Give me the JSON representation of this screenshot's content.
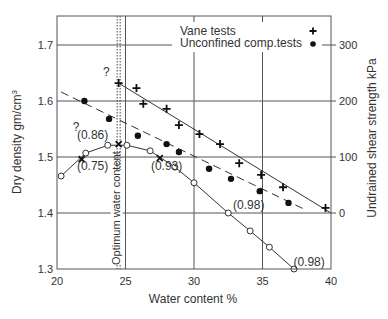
{
  "chart_data": {
    "type": "scatter",
    "title": "",
    "xlabel": "Water content %",
    "ylabel": "Dry density gm/cm3",
    "ylabel_parts": {
      "base": "Dry density gm/cm",
      "sup": "3"
    },
    "y2label": "Undrained shear strength kPa",
    "xlim": [
      20,
      40
    ],
    "ylim": [
      1.3,
      1.75
    ],
    "y2lim": [
      -100,
      350
    ],
    "x_ticks": [
      20,
      25,
      30,
      35,
      40
    ],
    "y_ticks": [
      1.3,
      1.4,
      1.5,
      1.6,
      1.7
    ],
    "y_tick_labels": [
      "1.3",
      "1.4",
      "1.5",
      "1.6",
      "1.7"
    ],
    "y2_ticks": [
      0,
      100,
      200,
      300
    ],
    "grid": true,
    "legend": {
      "position": "upper right",
      "entries": [
        {
          "label": "Vane tests",
          "marker": "+"
        },
        {
          "label": "Unconfined comp.tests",
          "marker": "●"
        }
      ]
    },
    "optimum_water_content": {
      "x": 24.5,
      "label": "Optimum water content"
    },
    "series": [
      {
        "name": "Vane tests",
        "axis": "right",
        "marker": "plus",
        "line": "solid",
        "x": [
          24.5,
          25.8,
          26.3,
          28.0,
          28.9,
          30.4,
          31.9,
          33.3,
          34.9,
          36.5,
          39.6
        ],
        "y": [
          232,
          223,
          195,
          186,
          157,
          141,
          123,
          89,
          68,
          46,
          9
        ],
        "fit_line": {
          "x": [
            24.5,
            40
          ],
          "y": [
            232,
            0
          ]
        }
      },
      {
        "name": "Unconfined comp.tests",
        "axis": "right",
        "marker": "filled-circle",
        "line": "dashed",
        "x": [
          22.0,
          23.8,
          25.9,
          28.0,
          28.9,
          31.1,
          32.7,
          34.8,
          36.9
        ],
        "y": [
          200,
          168,
          138,
          123,
          109,
          79,
          61,
          39,
          18
        ],
        "fit_line": {
          "x": [
            20.3,
            38.2
          ],
          "y": [
            216,
            5
          ]
        }
      },
      {
        "name": "Compaction curve",
        "axis": "left",
        "marker": "open-circle",
        "line": "solid",
        "x": [
          20.3,
          22.1,
          23.7,
          25.1,
          26.8,
          28.6,
          30.0,
          32.5,
          34.1,
          35.5,
          37.3
        ],
        "y": [
          1.466,
          1.507,
          1.521,
          1.521,
          1.511,
          1.482,
          1.454,
          1.4,
          1.368,
          1.339,
          1.3
        ]
      },
      {
        "name": "Degree of saturation markers",
        "axis": "left",
        "marker": "x",
        "x": [
          21.8,
          24.5,
          27.5
        ],
        "y": [
          1.496,
          1.523,
          1.498
        ]
      }
    ],
    "annotations": [
      {
        "text": "?",
        "x": 23.6,
        "y": 1.645
      },
      {
        "text": "?",
        "x": 21.4,
        "y": 1.547
      },
      {
        "text": "(0.86)",
        "x": 22.6,
        "y": 1.532
      },
      {
        "text": "(0.75)",
        "x": 22.6,
        "y": 1.476
      },
      {
        "text": "(0.93)",
        "x": 28.0,
        "y": 1.476
      },
      {
        "text": "(0.98)",
        "x": 34.0,
        "y": 1.408
      },
      {
        "text": "(0.98)",
        "x": 38.4,
        "y": 1.305
      }
    ]
  }
}
